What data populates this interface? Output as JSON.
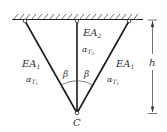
{
  "diagram": {
    "type": "truss",
    "ceiling": {
      "hatched": true
    },
    "members": [
      {
        "id": "left",
        "label": "EA",
        "label_sub": "1",
        "alpha": "α",
        "alpha_sub": "T",
        "alpha_subsub": "1"
      },
      {
        "id": "center",
        "label": "EA",
        "label_sub": "2",
        "alpha": "α",
        "alpha_sub": "T",
        "alpha_subsub": "2"
      },
      {
        "id": "right",
        "label": "EA",
        "label_sub": "1",
        "alpha": "α",
        "alpha_sub": "T",
        "alpha_subsub": "1"
      }
    ],
    "angle_label": "β",
    "node_label": "C",
    "dimension_label": "h",
    "colors": {
      "line": "#1a1a1a",
      "text": "#333333"
    }
  }
}
